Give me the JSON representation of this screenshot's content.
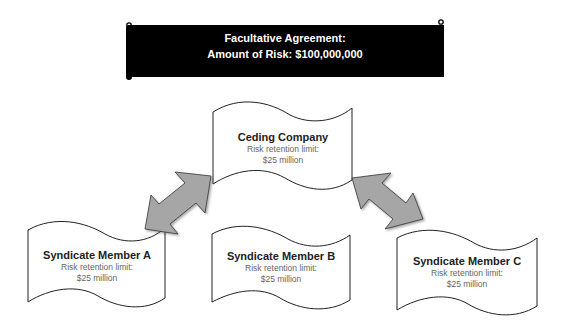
{
  "banner": {
    "line1": "Facultative Agreement:",
    "line2": "Amount of Risk: $100,000,000",
    "background": "#000000",
    "text_color": "#ffffff"
  },
  "nodes": [
    {
      "id": "ceding",
      "title": "Ceding Company",
      "line1": "Risk retention limit:",
      "line2": "$25 million"
    },
    {
      "id": "member_a",
      "title": "Syndicate Member A",
      "line1": "Risk retention limit:",
      "line2": "$25 million"
    },
    {
      "id": "member_b",
      "title": "Syndicate Member B",
      "line1": "Risk retention limit:",
      "line2": "$25 million"
    },
    {
      "id": "member_c",
      "title": "Syndicate Member C",
      "line1": "Risk retention limit:",
      "line2": "$25 million"
    }
  ],
  "connectors": [
    {
      "from": "ceding",
      "to": "member_a",
      "type": "double-arrow",
      "color": "#a6a6a6"
    },
    {
      "from": "ceding",
      "to": "member_c",
      "type": "double-arrow",
      "color": "#a6a6a6"
    }
  ]
}
